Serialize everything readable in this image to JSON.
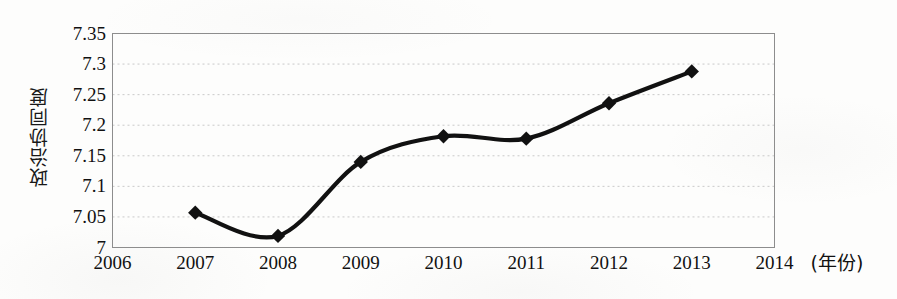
{
  "chart_data": {
    "type": "line",
    "title": "",
    "xlabel": "(年份)",
    "ylabel": "政治协同度",
    "x": [
      2007,
      2008,
      2009,
      2010,
      2011,
      2012,
      2013
    ],
    "values": [
      7.057,
      7.019,
      7.14,
      7.182,
      7.178,
      7.236,
      7.288
    ],
    "series": [
      {
        "name": "政治协同度",
        "values": [
          7.057,
          7.019,
          7.14,
          7.182,
          7.178,
          7.236,
          7.288
        ]
      }
    ],
    "x_tick_labels": [
      "2006",
      "2007",
      "2008",
      "2009",
      "2010",
      "2011",
      "2012",
      "2013",
      "2014"
    ],
    "y_tick_labels": [
      "7",
      "7.05",
      "7.1",
      "7.15",
      "7.2",
      "7.25",
      "7.3",
      "7.35"
    ],
    "y_tick_values": [
      7,
      7.05,
      7.1,
      7.15,
      7.2,
      7.25,
      7.3,
      7.35
    ],
    "xlim": [
      2006,
      2014
    ],
    "ylim": [
      7,
      7.35
    ],
    "grid": true,
    "grid_style": "dotted-horizontal",
    "legend": "none",
    "marker": "diamond",
    "line_color": "#111111",
    "marker_color": "#111111",
    "plot_border_color": "#8a8a8a",
    "background_color": "#fdfdfc"
  },
  "axis": {
    "y_title": "政治协同度",
    "x_unit_label": "(年份)"
  }
}
